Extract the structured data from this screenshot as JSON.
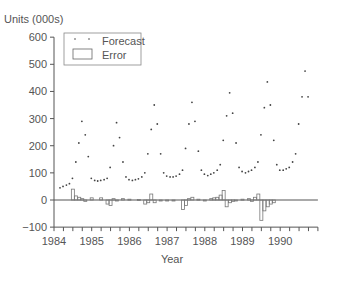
{
  "chart_data": {
    "type": "line",
    "title": "",
    "ylabel": "Units (000s)",
    "xlabel": "Year",
    "ylim": [
      -100,
      600
    ],
    "yticks": [
      600,
      500,
      400,
      300,
      200,
      100,
      0,
      -100
    ],
    "xticks": [
      "1984",
      "1985",
      "1986",
      "1987",
      "1988",
      "1989",
      "1990"
    ],
    "xlim": [
      1984,
      1991
    ],
    "grid": false,
    "legend": {
      "position": "upper-left",
      "entries": [
        "Forecast",
        "Error"
      ]
    },
    "series": [
      {
        "name": "Forecast",
        "style": "dotted",
        "x": [
          1984.0,
          1984.08,
          1984.17,
          1984.25,
          1984.33,
          1984.42,
          1984.5,
          1984.58,
          1984.67,
          1984.75,
          1984.83,
          1984.92,
          1985.0,
          1985.08,
          1985.17,
          1985.25,
          1985.33,
          1985.42,
          1985.5,
          1985.58,
          1985.67,
          1985.75,
          1985.83,
          1985.92,
          1986.0,
          1986.08,
          1986.17,
          1986.25,
          1986.33,
          1986.42,
          1986.5,
          1986.58,
          1986.67,
          1986.75,
          1986.83,
          1986.92,
          1987.0,
          1987.08,
          1987.17,
          1987.25,
          1987.33,
          1987.42,
          1987.5,
          1987.58,
          1987.67,
          1987.75,
          1987.83,
          1987.92,
          1988.0,
          1988.08,
          1988.17,
          1988.25,
          1988.33,
          1988.42,
          1988.5,
          1988.58,
          1988.67,
          1988.75,
          1988.83,
          1988.92,
          1989.0,
          1989.08,
          1989.17,
          1989.25,
          1989.33,
          1989.42,
          1989.5,
          1989.58,
          1989.67,
          1989.75,
          1989.83,
          1989.92,
          1990.0,
          1990.08,
          1990.17,
          1990.25,
          1990.33,
          1990.42,
          1990.5,
          1990.58
        ],
        "values": [
          45,
          50,
          55,
          60,
          80,
          140,
          210,
          290,
          240,
          160,
          80,
          72,
          70,
          72,
          75,
          80,
          120,
          200,
          285,
          230,
          140,
          85,
          75,
          72,
          75,
          78,
          85,
          100,
          170,
          260,
          350,
          280,
          170,
          100,
          88,
          85,
          85,
          88,
          95,
          110,
          190,
          280,
          360,
          290,
          180,
          110,
          95,
          90,
          95,
          100,
          110,
          130,
          220,
          310,
          395,
          320,
          210,
          120,
          105,
          100,
          105,
          110,
          120,
          140,
          240,
          340,
          435,
          350,
          220,
          130,
          110,
          110,
          115,
          120,
          140,
          170,
          280,
          380,
          475,
          380
        ]
      },
      {
        "name": "Error",
        "style": "bar",
        "x": [
          1984.5,
          1984.58,
          1984.67,
          1984.75,
          1984.83,
          1985.0,
          1985.25,
          1985.42,
          1985.5,
          1985.58,
          1985.67,
          1985.83,
          1986.0,
          1986.25,
          1986.42,
          1986.5,
          1986.58,
          1986.67,
          1986.83,
          1987.0,
          1987.17,
          1987.42,
          1987.5,
          1987.58,
          1987.67,
          1987.83,
          1988.0,
          1988.17,
          1988.25,
          1988.33,
          1988.42,
          1988.5,
          1988.58,
          1988.67,
          1988.75,
          1988.83,
          1989.0,
          1989.17,
          1989.25,
          1989.33,
          1989.42,
          1989.5,
          1989.58,
          1989.67,
          1989.75,
          1989.83
        ],
        "values": [
          40,
          15,
          10,
          5,
          -5,
          8,
          8,
          -15,
          -20,
          5,
          -3,
          5,
          3,
          2,
          -15,
          -10,
          22,
          -10,
          -3,
          -2,
          -3,
          -35,
          -20,
          5,
          10,
          3,
          -3,
          5,
          8,
          10,
          18,
          35,
          -25,
          -10,
          -5,
          -3,
          3,
          5,
          -5,
          10,
          22,
          -75,
          -40,
          -25,
          -15,
          -10
        ]
      }
    ]
  },
  "axes": {
    "ylabel": "Units (000s)",
    "xlabel": "Year",
    "yticks": [
      "600",
      "500",
      "400",
      "300",
      "200",
      "100",
      "0",
      "−100"
    ],
    "xticks": [
      "1984",
      "1985",
      "1986",
      "1987",
      "1988",
      "1989",
      "1990"
    ]
  },
  "legend": {
    "forecast_label": "Forecast",
    "error_label": "Error"
  },
  "colors": {
    "axis": "#555555",
    "dot": "#444444",
    "bar_stroke": "#777777"
  }
}
